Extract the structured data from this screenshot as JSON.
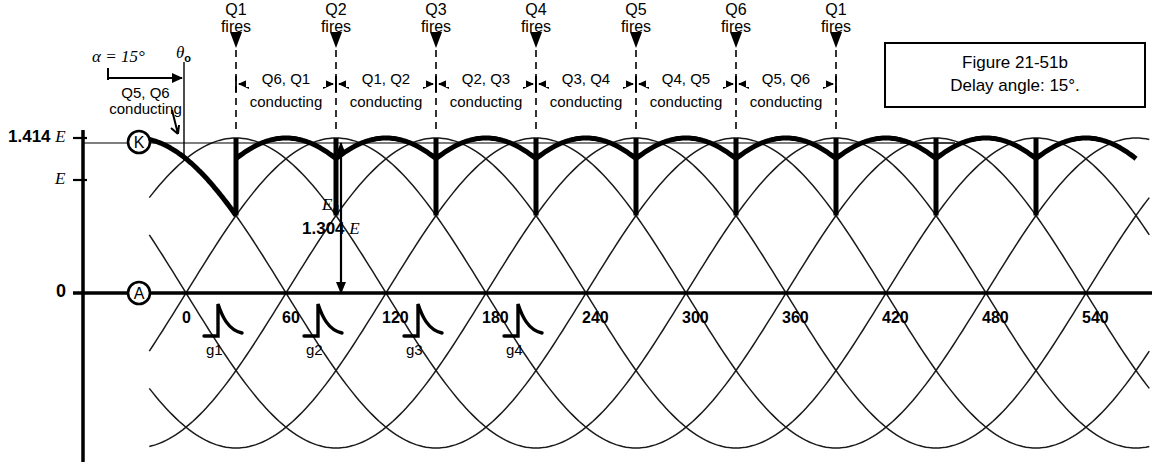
{
  "figure": {
    "caption_line1": "Figure 21-51b",
    "caption_line2": "Delay angle: 15°."
  },
  "annotations": {
    "alpha_label": "α = 15°",
    "theta_label": "θ",
    "theta_sub": "o",
    "initial_conducting_line1": "Q5, Q6",
    "initial_conducting_line2": "conducting",
    "cathode_marker": "K",
    "anode_marker": "A",
    "ed_symbol": "E",
    "ed_sub": "d",
    "ed_value": "1.304",
    "ed_unit": "E"
  },
  "y_axis": {
    "ticks": [
      {
        "value_bold": "1.414",
        "unit": "E",
        "y": 138
      },
      {
        "value_bold": "",
        "unit": "E",
        "y": 180
      },
      {
        "value_bold": "0",
        "unit": "",
        "y": 293
      }
    ]
  },
  "x_axis": {
    "unit": "degrees",
    "ticks": [
      "0",
      "60",
      "120",
      "180",
      "240",
      "300",
      "360",
      "420",
      "480",
      "540"
    ],
    "tick_degrees": [
      0,
      60,
      120,
      180,
      240,
      300,
      360,
      420,
      480,
      540
    ],
    "gate_pulses": [
      {
        "label": "g1",
        "degree": 0
      },
      {
        "label": "g2",
        "degree": 60
      },
      {
        "label": "g3",
        "degree": 120
      },
      {
        "label": "g4",
        "degree": 180
      }
    ]
  },
  "firing_events": [
    {
      "device": "Q1",
      "action": "fires",
      "degree": 30
    },
    {
      "device": "Q2",
      "action": "fires",
      "degree": 90
    },
    {
      "device": "Q3",
      "action": "fires",
      "degree": 150
    },
    {
      "device": "Q4",
      "action": "fires",
      "degree": 210
    },
    {
      "device": "Q5",
      "action": "fires",
      "degree": 270
    },
    {
      "device": "Q6",
      "action": "fires",
      "degree": 330
    },
    {
      "device": "Q1",
      "action": "fires",
      "degree": 390
    }
  ],
  "conduction_intervals": [
    {
      "pair": "Q6, Q1",
      "state": "conducting",
      "start_degree": 30,
      "end_degree": 90
    },
    {
      "pair": "Q1, Q2",
      "state": "conducting",
      "start_degree": 90,
      "end_degree": 150
    },
    {
      "pair": "Q2, Q3",
      "state": "conducting",
      "start_degree": 150,
      "end_degree": 210
    },
    {
      "pair": "Q3, Q4",
      "state": "conducting",
      "start_degree": 210,
      "end_degree": 270
    },
    {
      "pair": "Q4, Q5",
      "state": "conducting",
      "start_degree": 270,
      "end_degree": 330
    },
    {
      "pair": "Q5, Q6",
      "state": "conducting",
      "start_degree": 330,
      "end_degree": 390
    }
  ],
  "chart_data": {
    "type": "line",
    "title": "Figure 21-51b  Delay angle: 15°.",
    "xlabel": "Electrical degrees",
    "ylabel": "Voltage",
    "xlim": [
      -18,
      576
    ],
    "ylim": [
      -1.414,
      1.414
    ],
    "grid": false,
    "legend": "none",
    "delay_angle_deg": 15,
    "annotations": {
      "Ed_average": 1.304,
      "Ed_units": "E",
      "peak": 1.414,
      "peak_units": "E",
      "rms": 1.0,
      "rms_units": "E"
    },
    "series": [
      {
        "name": "phase-A-sine",
        "kind": "thin-sine",
        "amplitude": 1.414,
        "phase_deg": 0,
        "period_deg": 360
      },
      {
        "name": "phase-B-sine",
        "kind": "thin-sine",
        "amplitude": 1.414,
        "phase_deg": 120,
        "period_deg": 360
      },
      {
        "name": "phase-C-sine",
        "kind": "thin-sine",
        "amplitude": 1.414,
        "phase_deg": 240,
        "period_deg": 360
      },
      {
        "name": "phase-A-inv-sine",
        "kind": "thin-sine",
        "amplitude": 1.414,
        "phase_deg": 180,
        "period_deg": 360
      },
      {
        "name": "phase-B-inv-sine",
        "kind": "thin-sine",
        "amplitude": 1.414,
        "phase_deg": 300,
        "period_deg": 360
      },
      {
        "name": "phase-C-inv-sine",
        "kind": "thin-sine",
        "amplitude": 1.414,
        "phase_deg": 60,
        "period_deg": 360
      },
      {
        "name": "rectified-output",
        "kind": "thick-envelope",
        "description": "Six-pulse rectified output delayed 15 degrees; each 60-degree segment rides the crest of successive line-to-line sines and drops vertically at each firing point.",
        "commutation_degrees": [
          30,
          90,
          150,
          210,
          270,
          330,
          390,
          450,
          510
        ],
        "segment_peak": 1.414,
        "segment_min": 1.225
      }
    ]
  }
}
